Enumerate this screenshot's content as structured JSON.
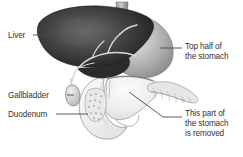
{
  "figure": {
    "background_color": "#ffffff",
    "text_color": "#333333",
    "leader_line_color": "#4a4a4a"
  },
  "labels": {
    "liver": {
      "text": "Liver"
    },
    "gallbladder": {
      "text": "Gallbladder"
    },
    "duodenum": {
      "text": "Duodenum"
    },
    "top_half_stomach": {
      "line1": "Top half of",
      "line2": "the stomach"
    },
    "removed_part": {
      "line1": "This part of",
      "line2": "the stomach",
      "line3": "is removed"
    }
  },
  "structures": [
    {
      "name": "liver",
      "tone": "#3a3a3a"
    },
    {
      "name": "stomach-upper",
      "tone": "#a9a9a9"
    },
    {
      "name": "stomach-lower",
      "tone": "#ededed"
    },
    {
      "name": "gallbladder",
      "tone": "#d6d6d6"
    },
    {
      "name": "duodenum",
      "tone": "#efefef"
    },
    {
      "name": "pancreas",
      "tone": "#e4e4e4"
    },
    {
      "name": "bile-duct",
      "tone": "#dcdcdc"
    },
    {
      "name": "esophagus",
      "tone": "#8a8a8a"
    }
  ]
}
